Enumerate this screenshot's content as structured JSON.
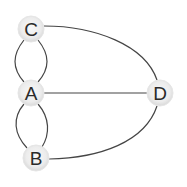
{
  "diagram": {
    "type": "graph",
    "title": "",
    "colors": {
      "edge": "#454545",
      "node_fill_center": "#f7f7f7",
      "node_fill_edge": "#dcdcdc",
      "node_stroke": "#e3e3e3",
      "label": "#2a2a2a",
      "background": "#ffffff"
    },
    "nodes": [
      {
        "id": "C",
        "label": "C",
        "x": 31,
        "y": 29,
        "r": 13
      },
      {
        "id": "A",
        "label": "A",
        "x": 31,
        "y": 93,
        "r": 13
      },
      {
        "id": "D",
        "label": "D",
        "x": 160,
        "y": 93,
        "r": 13
      },
      {
        "id": "B",
        "label": "B",
        "x": 36,
        "y": 158,
        "r": 13
      }
    ],
    "edges": [
      {
        "from": "C",
        "to": "A",
        "shape": "curve-left"
      },
      {
        "from": "C",
        "to": "A",
        "shape": "curve-right"
      },
      {
        "from": "A",
        "to": "B",
        "shape": "curve-left"
      },
      {
        "from": "A",
        "to": "B",
        "shape": "curve-right"
      },
      {
        "from": "A",
        "to": "D",
        "shape": "straight"
      },
      {
        "from": "C",
        "to": "D",
        "shape": "arc"
      },
      {
        "from": "B",
        "to": "D",
        "shape": "arc"
      }
    ]
  }
}
